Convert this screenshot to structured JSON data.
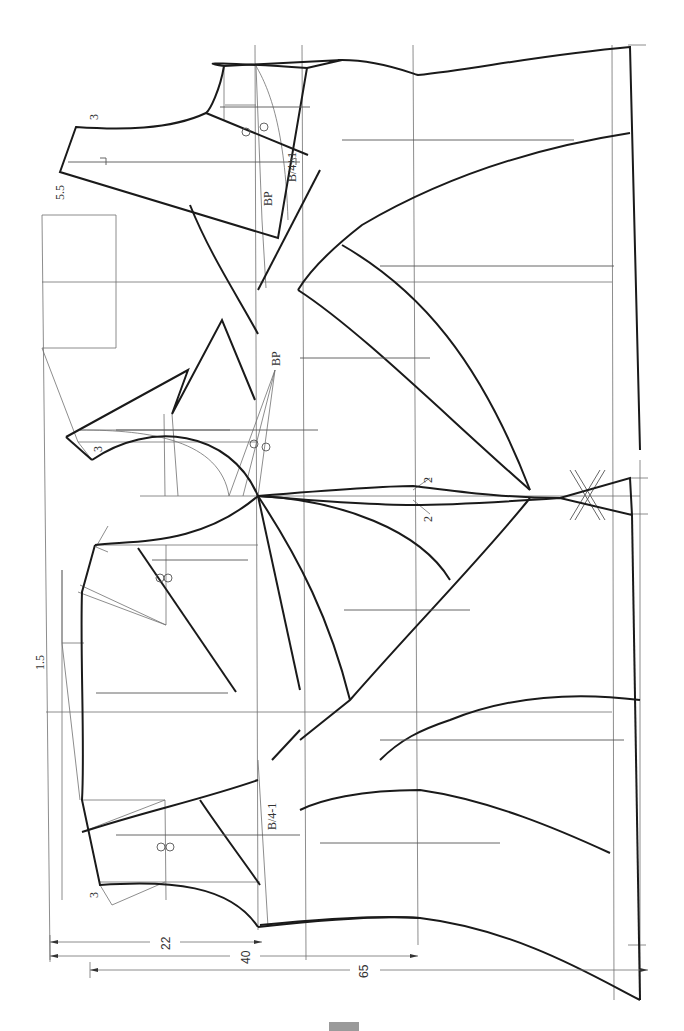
{
  "diagram": {
    "type": "garment pattern draft (rotated 90°)",
    "colors": {
      "outline": "#1a1a1a",
      "construction": "#707070",
      "footer_bar": "#9a9a9a"
    },
    "labels": {
      "bp_top": "BP",
      "bp_middle": "BP",
      "bust_plus": "B/4+1",
      "bust_minus": "B/4-1",
      "neck_offset_top": "3",
      "neck_offset_mid": "3",
      "neck_offset_bottom": "3",
      "shoulder_offset": "5.5",
      "back_offset": "1.5",
      "side_ease_upper": "2",
      "side_ease_lower": "2"
    },
    "dimensions": {
      "d22": "22",
      "d40": "40",
      "d65": "65"
    },
    "symbols": {
      "grainline": "grainline-arrow",
      "notch": "double-circle-notch",
      "hip_notch": "double-slash-notch"
    }
  }
}
